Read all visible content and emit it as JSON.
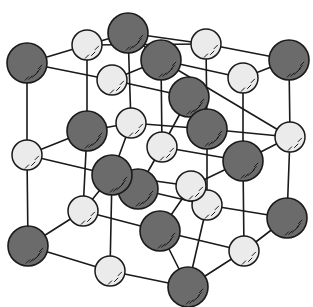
{
  "diagram": {
    "title": "",
    "type": "crystal-lattice",
    "colors": {
      "large_ion": "#6b6b6b",
      "small_ion": "#ebebeb",
      "bond": "#1a1a1a",
      "background": "#ffffff"
    },
    "large_ions": [
      {
        "id": "L1",
        "x": 27,
        "y": 63,
        "r": 20
      },
      {
        "id": "L2",
        "x": 128,
        "y": 33,
        "r": 20
      },
      {
        "id": "L3",
        "x": 161,
        "y": 60,
        "r": 20
      },
      {
        "id": "L4",
        "x": 289,
        "y": 60,
        "r": 20
      },
      {
        "id": "L5",
        "x": 189,
        "y": 97,
        "r": 20
      },
      {
        "id": "L6",
        "x": 87,
        "y": 131,
        "r": 20
      },
      {
        "id": "L7",
        "x": 207,
        "y": 129,
        "r": 20
      },
      {
        "id": "L9",
        "x": 138,
        "y": 189,
        "r": 20
      },
      {
        "id": "L8",
        "x": 112,
        "y": 175,
        "r": 20
      },
      {
        "id": "L10",
        "x": 243,
        "y": 161,
        "r": 20
      },
      {
        "id": "L11",
        "x": 287,
        "y": 218,
        "r": 20
      },
      {
        "id": "L12",
        "x": 28,
        "y": 246,
        "r": 20
      },
      {
        "id": "L13",
        "x": 160,
        "y": 231,
        "r": 20
      },
      {
        "id": "L14",
        "x": 188,
        "y": 287,
        "r": 20
      }
    ],
    "small_ions": [
      {
        "id": "S1",
        "x": 87,
        "y": 45,
        "r": 15
      },
      {
        "id": "S2",
        "x": 206,
        "y": 44,
        "r": 15
      },
      {
        "id": "S3",
        "x": 112,
        "y": 80,
        "r": 15
      },
      {
        "id": "S4",
        "x": 243,
        "y": 78,
        "r": 15
      },
      {
        "id": "S5",
        "x": 27,
        "y": 155,
        "r": 15
      },
      {
        "id": "S6",
        "x": 131,
        "y": 123,
        "r": 15
      },
      {
        "id": "S7",
        "x": 162,
        "y": 147,
        "r": 15
      },
      {
        "id": "S8",
        "x": 290,
        "y": 137,
        "r": 15
      },
      {
        "id": "S9",
        "x": 83,
        "y": 211,
        "r": 15
      },
      {
        "id": "S10",
        "x": 191,
        "y": 186,
        "r": 15
      },
      {
        "id": "S11",
        "x": 207,
        "y": 205,
        "r": 15
      },
      {
        "id": "S12",
        "x": 110,
        "y": 271,
        "r": 15
      },
      {
        "id": "S13",
        "x": 244,
        "y": 251,
        "r": 15
      }
    ],
    "bonds": [
      [
        "L1",
        "S1"
      ],
      [
        "S1",
        "L2"
      ],
      [
        "L1",
        "S3"
      ],
      [
        "S1",
        "S2"
      ],
      [
        "L2",
        "S2"
      ],
      [
        "L2",
        "L3"
      ],
      [
        "S3",
        "L3"
      ],
      [
        "L3",
        "S4"
      ],
      [
        "S2",
        "L4"
      ],
      [
        "S4",
        "L4"
      ],
      [
        "S3",
        "L5"
      ],
      [
        "L3",
        "S8"
      ],
      [
        "L1",
        "S5"
      ],
      [
        "S5",
        "L6"
      ],
      [
        "S5",
        "L8"
      ],
      [
        "S1",
        "L6"
      ],
      [
        "L2",
        "S6"
      ],
      [
        "S6",
        "L6"
      ],
      [
        "S6",
        "L7"
      ],
      [
        "L3",
        "S7"
      ],
      [
        "L5",
        "S7"
      ],
      [
        "L5",
        "L7"
      ],
      [
        "S2",
        "L7"
      ],
      [
        "S4",
        "L10"
      ],
      [
        "L4",
        "S8"
      ],
      [
        "L7",
        "S8"
      ],
      [
        "S7",
        "L10"
      ],
      [
        "L10",
        "S8"
      ],
      [
        "L6",
        "S9"
      ],
      [
        "L8",
        "S9"
      ],
      [
        "S6",
        "L8"
      ],
      [
        "S7",
        "L9"
      ],
      [
        "L8",
        "S10"
      ],
      [
        "L9",
        "S11"
      ],
      [
        "S10",
        "L10"
      ],
      [
        "L7",
        "S11"
      ],
      [
        "L10",
        "S13"
      ],
      [
        "S8",
        "L11"
      ],
      [
        "S11",
        "L11"
      ],
      [
        "S5",
        "L12"
      ],
      [
        "L12",
        "S9"
      ],
      [
        "L12",
        "S12"
      ],
      [
        "S9",
        "L13"
      ],
      [
        "L8",
        "S12"
      ],
      [
        "S10",
        "L13"
      ],
      [
        "L13",
        "S13"
      ],
      [
        "L13",
        "L14"
      ],
      [
        "S12",
        "L14"
      ],
      [
        "L14",
        "S13"
      ],
      [
        "S13",
        "L11"
      ],
      [
        "S11",
        "L14"
      ],
      [
        "S10",
        "S11"
      ]
    ]
  }
}
